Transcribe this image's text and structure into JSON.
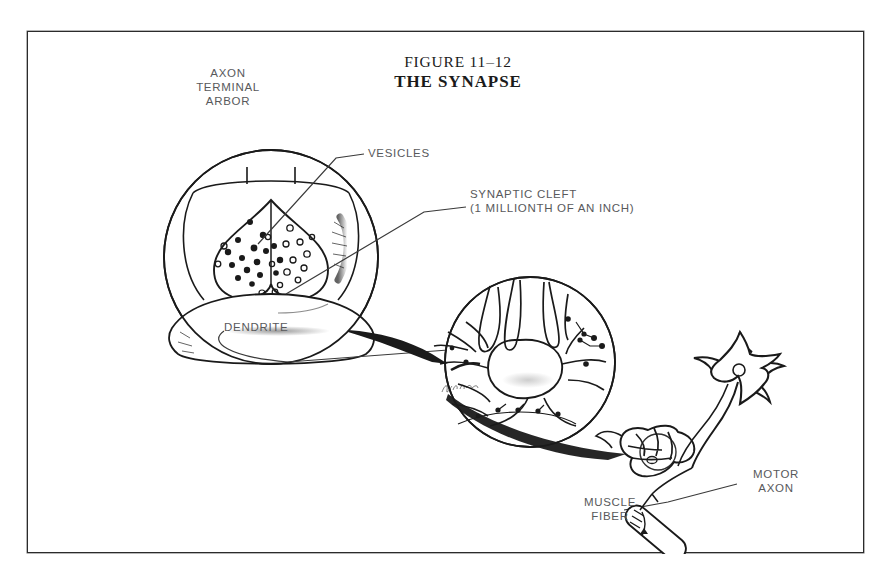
{
  "figure": {
    "title_line1": "FIGURE 11–12",
    "title_line2": "THE SYNAPSE",
    "border_color": "#2b2b2b",
    "ink_color": "#1a1a1a",
    "label_color": "#58595b",
    "background": "#ffffff"
  },
  "labels": {
    "axon_terminal_arbor": "AXON\nTERMINAL\nARBOR",
    "vesicles": "VESICLES",
    "synaptic_cleft": "SYNAPTIC CLEFT\n(1 MILLIONTH OF AN INCH)",
    "dendrite": "DENDRITE",
    "motor_axon": "MOTOR\nAXON",
    "muscle_fiber": "MUSCLE\nFIBER"
  },
  "diagram": {
    "panels": [
      {
        "name": "synapse-closeup",
        "description": "Large circular cutaway of an axon terminal arbor releasing vesicles across the synaptic cleft onto a dendrite",
        "center_x": 243,
        "center_y": 225,
        "radius": 107
      },
      {
        "name": "neuron-micrograph",
        "description": "Circular magnified view of a neuron cell body with dendrites and synaptic boutons",
        "center_x": 502,
        "center_y": 330,
        "radius": 85
      },
      {
        "name": "motor-neuron",
        "description": "Whole motor neuron with star-shaped soma, dendrites and motor axon running to a muscle fiber",
        "center_x": 700,
        "center_y": 390
      },
      {
        "name": "muscle-fiber",
        "description": "Tilted capsule-shaped muscle fiber with a motor end plate",
        "center_x": 627,
        "center_y": 500
      }
    ],
    "vesicle_counts": {
      "filled_in_terminal": 16,
      "open_in_terminal": 14,
      "released_in_cleft": 12
    },
    "signature": "artist signature (cursive, illegible)"
  }
}
